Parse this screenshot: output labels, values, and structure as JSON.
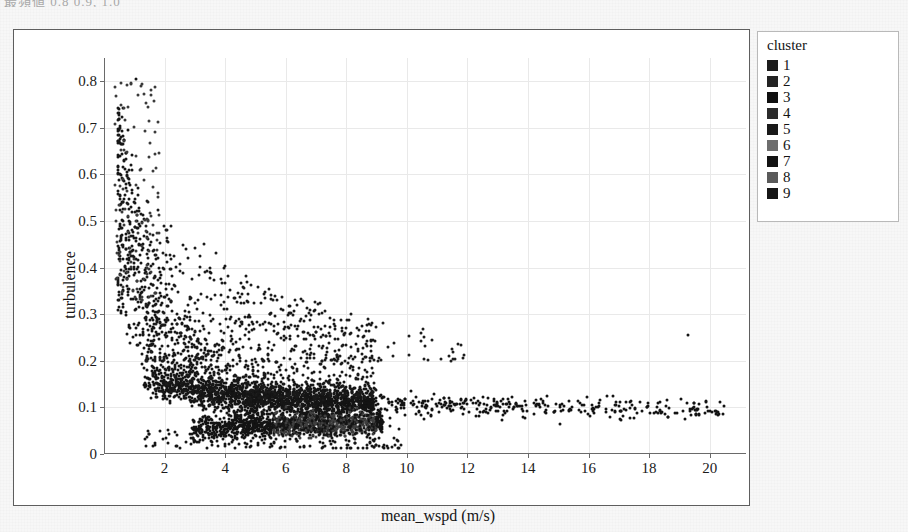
{
  "top_clipped_text": "最頻値 0.8 0.9, 1.0",
  "chart_data": {
    "type": "scatter",
    "title": "",
    "xlabel": "mean_wspd (m/s)",
    "ylabel": "turbulence",
    "xlim": [
      0,
      21.2
    ],
    "ylim": [
      0,
      0.85
    ],
    "xticks": [
      2,
      4,
      6,
      8,
      10,
      12,
      14,
      16,
      18,
      20
    ],
    "xtick_labels": [
      "2",
      "4",
      "6",
      "8",
      "10",
      "12",
      "14",
      "16",
      "18",
      "20"
    ],
    "yticks": [
      0,
      0.1,
      0.2,
      0.3,
      0.4,
      0.5,
      0.6,
      0.7,
      0.8
    ],
    "ytick_labels": [
      "0",
      "0.1",
      "0.2",
      "0.3",
      "0.4",
      "0.5",
      "0.6",
      "0.7",
      "0.8"
    ],
    "grid": true,
    "grid_color": "#e9e9e9",
    "point_color": "#141414",
    "point_size_px": 3,
    "legend_position": "right-outside",
    "legend_title": "cluster",
    "series": [
      {
        "name": "1",
        "swatch_color": "#1c1c1c",
        "points": [
          [
            1.05,
            0.805
          ],
          [
            0.62,
            0.742
          ],
          [
            0.78,
            0.695
          ],
          [
            0.55,
            0.665
          ],
          [
            0.92,
            0.641
          ],
          [
            0.7,
            0.612
          ],
          [
            0.5,
            0.589
          ],
          [
            1.12,
            0.572
          ],
          [
            0.66,
            0.548
          ],
          [
            0.88,
            0.531
          ],
          [
            1.3,
            0.513
          ],
          [
            0.58,
            0.502
          ],
          [
            1.02,
            0.487
          ],
          [
            0.74,
            0.472
          ],
          [
            1.45,
            0.461
          ],
          [
            0.62,
            0.449
          ],
          [
            0.95,
            0.438
          ],
          [
            1.2,
            0.428
          ],
          [
            0.52,
            0.418
          ],
          [
            0.8,
            0.409
          ]
        ]
      },
      {
        "name": "2",
        "swatch_color": "#232323",
        "points": [
          [
            0.9,
            0.398
          ],
          [
            1.35,
            0.388
          ],
          [
            0.66,
            0.379
          ],
          [
            1.1,
            0.371
          ],
          [
            1.62,
            0.362
          ],
          [
            0.78,
            0.354
          ],
          [
            1.25,
            0.347
          ],
          [
            1.88,
            0.339
          ],
          [
            0.95,
            0.332
          ],
          [
            1.5,
            0.325
          ],
          [
            2.1,
            0.318
          ],
          [
            1.05,
            0.311
          ],
          [
            1.7,
            0.305
          ],
          [
            0.72,
            0.299
          ],
          [
            1.4,
            0.293
          ],
          [
            2.35,
            0.287
          ],
          [
            1.15,
            0.281
          ],
          [
            1.95,
            0.276
          ],
          [
            0.85,
            0.27
          ],
          [
            1.58,
            0.265
          ]
        ]
      },
      {
        "name": "3",
        "swatch_color": "#0f0f0f",
        "points": [
          [
            2.55,
            0.26
          ],
          [
            1.3,
            0.255
          ],
          [
            2.05,
            0.251
          ],
          [
            3.1,
            0.246
          ],
          [
            1.62,
            0.242
          ],
          [
            2.45,
            0.238
          ],
          [
            1.1,
            0.234
          ],
          [
            2.9,
            0.23
          ],
          [
            1.85,
            0.226
          ],
          [
            3.45,
            0.222
          ],
          [
            1.45,
            0.219
          ],
          [
            2.3,
            0.215
          ],
          [
            3.85,
            0.212
          ],
          [
            1.7,
            0.208
          ],
          [
            2.7,
            0.205
          ],
          [
            4.25,
            0.202
          ],
          [
            1.95,
            0.199
          ],
          [
            3.2,
            0.196
          ],
          [
            1.25,
            0.193
          ],
          [
            2.55,
            0.19
          ]
        ]
      },
      {
        "name": "4",
        "swatch_color": "#2b2b2b",
        "points": [
          [
            4.65,
            0.187
          ],
          [
            2.15,
            0.184
          ],
          [
            3.55,
            0.182
          ],
          [
            5.1,
            0.179
          ],
          [
            2.8,
            0.176
          ],
          [
            4.05,
            0.174
          ],
          [
            1.8,
            0.171
          ],
          [
            5.6,
            0.169
          ],
          [
            3.25,
            0.166
          ],
          [
            4.5,
            0.164
          ],
          [
            2.4,
            0.162
          ],
          [
            6.1,
            0.159
          ],
          [
            3.7,
            0.157
          ],
          [
            5.05,
            0.155
          ],
          [
            2.65,
            0.153
          ],
          [
            6.7,
            0.151
          ],
          [
            4.2,
            0.149
          ],
          [
            5.55,
            0.147
          ],
          [
            3.05,
            0.145
          ],
          [
            7.3,
            0.143
          ]
        ]
      },
      {
        "name": "5",
        "swatch_color": "#191919",
        "points": [
          [
            4.7,
            0.141
          ],
          [
            6.15,
            0.139
          ],
          [
            3.4,
            0.137
          ],
          [
            7.9,
            0.136
          ],
          [
            5.25,
            0.134
          ],
          [
            6.8,
            0.132
          ],
          [
            3.85,
            0.131
          ],
          [
            8.55,
            0.129
          ],
          [
            5.8,
            0.128
          ],
          [
            7.4,
            0.126
          ],
          [
            4.35,
            0.125
          ],
          [
            9.2,
            0.123
          ],
          [
            6.35,
            0.122
          ],
          [
            8.0,
            0.121
          ],
          [
            4.9,
            0.119
          ],
          [
            9.95,
            0.118
          ],
          [
            6.95,
            0.117
          ],
          [
            8.6,
            0.116
          ],
          [
            5.45,
            0.114
          ],
          [
            10.7,
            0.113
          ]
        ]
      },
      {
        "name": "6",
        "swatch_color": "#6d6d6d",
        "points": [
          [
            6.55,
            0.095
          ],
          [
            7.1,
            0.092
          ],
          [
            6.05,
            0.09
          ],
          [
            7.65,
            0.088
          ],
          [
            6.8,
            0.086
          ],
          [
            7.35,
            0.085
          ],
          [
            6.3,
            0.083
          ],
          [
            8.0,
            0.082
          ],
          [
            7.0,
            0.08
          ],
          [
            7.55,
            0.079
          ],
          [
            6.6,
            0.078
          ],
          [
            8.3,
            0.077
          ],
          [
            7.2,
            0.075
          ],
          [
            7.8,
            0.074
          ],
          [
            6.9,
            0.073
          ],
          [
            8.6,
            0.072
          ],
          [
            7.45,
            0.071
          ],
          [
            8.05,
            0.07
          ],
          [
            7.1,
            0.069
          ],
          [
            8.9,
            0.068
          ]
        ]
      },
      {
        "name": "7",
        "swatch_color": "#121212",
        "points": [
          [
            11.5,
            0.112
          ],
          [
            9.4,
            0.11
          ],
          [
            12.4,
            0.109
          ],
          [
            10.25,
            0.108
          ],
          [
            13.3,
            0.107
          ],
          [
            9.9,
            0.105
          ],
          [
            14.25,
            0.104
          ],
          [
            11.0,
            0.103
          ],
          [
            15.2,
            0.102
          ],
          [
            10.6,
            0.101
          ],
          [
            16.3,
            0.1
          ],
          [
            11.8,
            0.099
          ],
          [
            17.4,
            0.113
          ],
          [
            12.6,
            0.097
          ],
          [
            19.3,
            0.255
          ],
          [
            13.5,
            0.096
          ],
          [
            20.35,
            0.112
          ],
          [
            14.6,
            0.095
          ],
          [
            18.65,
            0.098
          ],
          [
            15.7,
            0.094
          ]
        ]
      },
      {
        "name": "8",
        "swatch_color": "#5a5a5a",
        "points": [
          [
            5.2,
            0.072
          ],
          [
            5.7,
            0.07
          ],
          [
            4.8,
            0.069
          ],
          [
            6.2,
            0.067
          ],
          [
            5.45,
            0.066
          ],
          [
            5.95,
            0.065
          ],
          [
            5.05,
            0.063
          ],
          [
            6.5,
            0.062
          ],
          [
            5.6,
            0.061
          ],
          [
            6.05,
            0.06
          ],
          [
            5.3,
            0.059
          ],
          [
            6.8,
            0.058
          ],
          [
            5.85,
            0.057
          ],
          [
            6.35,
            0.056
          ],
          [
            5.5,
            0.055
          ],
          [
            7.05,
            0.054
          ],
          [
            6.1,
            0.053
          ],
          [
            6.6,
            0.052
          ],
          [
            5.75,
            0.051
          ],
          [
            7.3,
            0.05
          ]
        ]
      },
      {
        "name": "9",
        "swatch_color": "#161616",
        "points": [
          [
            3.6,
            0.06
          ],
          [
            4.15,
            0.055
          ],
          [
            3.1,
            0.052
          ],
          [
            4.7,
            0.049
          ],
          [
            3.85,
            0.046
          ],
          [
            4.4,
            0.044
          ],
          [
            2.85,
            0.042
          ],
          [
            5.0,
            0.04
          ],
          [
            4.0,
            0.038
          ],
          [
            4.55,
            0.036
          ],
          [
            3.35,
            0.034
          ],
          [
            5.3,
            0.032
          ],
          [
            4.25,
            0.03
          ],
          [
            4.85,
            0.028
          ],
          [
            3.55,
            0.026
          ],
          [
            5.6,
            0.024
          ],
          [
            4.45,
            0.022
          ],
          [
            5.1,
            0.02
          ],
          [
            3.75,
            0.018
          ],
          [
            5.85,
            0.016
          ]
        ]
      }
    ],
    "cloud_note": "dense L-shaped cloud: high turbulence at low wind speed, decaying to ~0.1 baseline by 8 m/s, long sparse tail to 20 m/s"
  },
  "legend": {
    "title": "cluster",
    "items": [
      {
        "label": "1",
        "color": "#1c1c1c"
      },
      {
        "label": "2",
        "color": "#232323"
      },
      {
        "label": "3",
        "color": "#0f0f0f"
      },
      {
        "label": "4",
        "color": "#2b2b2b"
      },
      {
        "label": "5",
        "color": "#191919"
      },
      {
        "label": "6",
        "color": "#6d6d6d"
      },
      {
        "label": "7",
        "color": "#121212"
      },
      {
        "label": "8",
        "color": "#5a5a5a"
      },
      {
        "label": "9",
        "color": "#161616"
      }
    ]
  }
}
